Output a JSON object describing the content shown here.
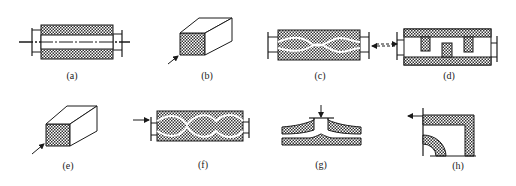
{
  "figure": {
    "panels": [
      {
        "id": "a",
        "label": "(a)",
        "description": "cylinder with hatched wall and straight axial channel, flanged ends, centerline"
      },
      {
        "id": "b",
        "label": "(b)",
        "description": "rectangular block with hatched front face, inlet arrow"
      },
      {
        "id": "c",
        "label": "(c)",
        "description": "hatched block with wavy internal channels, flanged ends"
      },
      {
        "id": "d",
        "label": "(d)",
        "description": "serpentine baffle channel with hatched walls, flanged ends, dashed inlet arrow from (c)"
      },
      {
        "id": "e",
        "label": "(e)",
        "description": "rectangular block with hatched front face, inlet arrow"
      },
      {
        "id": "f",
        "label": "(f)",
        "description": "hatched block with lens-shaped wavy channels, inlet arrow, flanged ends"
      },
      {
        "id": "g",
        "label": "(g)",
        "description": "radial flow between two hatched plates, top inlet arrow"
      },
      {
        "id": "h",
        "label": "(h)",
        "description": "quarter-section with hatched L-shaped wall and curved inner wall, outlet arrow"
      }
    ]
  },
  "colors": {
    "ink": "#1a1a1a",
    "background": "#ffffff"
  }
}
